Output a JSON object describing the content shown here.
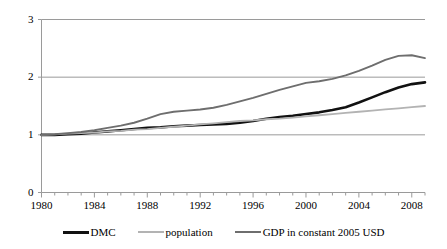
{
  "chart_data": {
    "type": "line",
    "title": "",
    "xlabel": "",
    "ylabel": "",
    "xlim": [
      1980,
      2009
    ],
    "ylim": [
      0,
      3
    ],
    "yticks": [
      0,
      1,
      2,
      3
    ],
    "xticks": [
      1980,
      1984,
      1988,
      1992,
      1996,
      2000,
      2004,
      2008
    ],
    "xtick_minor_step": 1,
    "grid": "horizontal",
    "legend_position": "bottom",
    "x": [
      1980,
      1981,
      1982,
      1983,
      1984,
      1985,
      1986,
      1987,
      1988,
      1989,
      1990,
      1991,
      1992,
      1993,
      1994,
      1995,
      1996,
      1997,
      1998,
      1999,
      2000,
      2001,
      2002,
      2003,
      2004,
      2005,
      2006,
      2007,
      2008,
      2009
    ],
    "series": [
      {
        "name": "DMC",
        "color": "#111111",
        "width": 2.6,
        "values": [
          1.0,
          1.0,
          1.01,
          1.02,
          1.04,
          1.06,
          1.08,
          1.1,
          1.12,
          1.13,
          1.15,
          1.16,
          1.17,
          1.18,
          1.19,
          1.21,
          1.24,
          1.28,
          1.31,
          1.33,
          1.36,
          1.39,
          1.43,
          1.48,
          1.56,
          1.65,
          1.74,
          1.82,
          1.88,
          1.91
        ]
      },
      {
        "name": "population",
        "color": "#b3b3b3",
        "width": 1.8,
        "values": [
          1.0,
          1.01,
          1.02,
          1.03,
          1.04,
          1.06,
          1.07,
          1.09,
          1.1,
          1.12,
          1.14,
          1.16,
          1.18,
          1.2,
          1.22,
          1.24,
          1.25,
          1.27,
          1.28,
          1.3,
          1.32,
          1.34,
          1.36,
          1.38,
          1.4,
          1.42,
          1.44,
          1.46,
          1.48,
          1.5
        ]
      },
      {
        "name": "GDP in constant 2005 USD",
        "color": "#6e6e6e",
        "width": 1.9,
        "values": [
          1.0,
          1.01,
          1.03,
          1.05,
          1.08,
          1.12,
          1.16,
          1.21,
          1.28,
          1.36,
          1.4,
          1.42,
          1.44,
          1.47,
          1.52,
          1.58,
          1.64,
          1.71,
          1.78,
          1.84,
          1.9,
          1.93,
          1.97,
          2.03,
          2.11,
          2.2,
          2.3,
          2.37,
          2.38,
          2.33
        ]
      }
    ]
  },
  "axis": {
    "ylabels": [
      "3",
      "2",
      "1",
      "0"
    ],
    "xlabels": [
      "1980",
      "1984",
      "1988",
      "1992",
      "1996",
      "2000",
      "2004",
      "2008"
    ]
  },
  "legend": {
    "items": [
      {
        "label": "DMC",
        "swatch": "dmc-line-swatch"
      },
      {
        "label": "population",
        "swatch": "population-line-swatch"
      },
      {
        "label": "GDP in constant 2005 USD",
        "swatch": "gdp-line-swatch"
      }
    ]
  },
  "colors": {
    "dmc": "#111111",
    "population": "#b3b3b3",
    "gdp": "#6e6e6e",
    "gridline": "#9a9a9a",
    "axis": "#9a9a9a"
  }
}
